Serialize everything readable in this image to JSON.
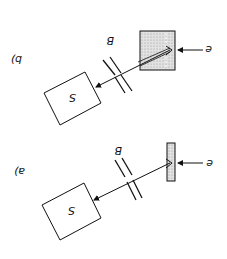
{
  "orientation": "rotated 180 degrees",
  "panels": [
    {
      "id": "b",
      "label": "b)",
      "source_label": "S",
      "beam_label": "B",
      "incident_label": "e",
      "target": "thick stippled block"
    },
    {
      "id": "a",
      "label": "a)",
      "source_label": "S",
      "beam_label": "B",
      "incident_label": "e",
      "target": "thin stippled plate"
    }
  ],
  "colors": {
    "stroke": "#111111",
    "stipple": "#d8d8d8"
  }
}
